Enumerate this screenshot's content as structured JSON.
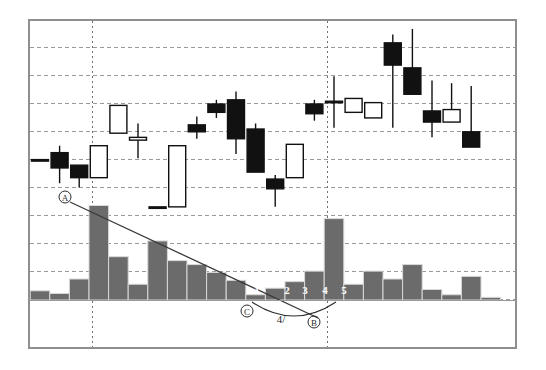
{
  "figure": {
    "background_color": "#ffffff",
    "frame_color": "#8f8f8f",
    "gridline_color": "#9a9a9a",
    "bull_body_color": "#ffffff",
    "bear_body_color": "#111111",
    "wick_color": "#111111",
    "volume_bar_color": "#6b6b6b",
    "volume_bar_edge_color": "#d9d9d9",
    "trendline_color": "#3a3a3a",
    "annotation_color": "#2b2b2b",
    "width": 546,
    "height": 370
  },
  "plot_area": {
    "left": 29,
    "top": 20,
    "right": 516,
    "bottom": 348,
    "price_panel_bottom": 300,
    "volume_baseline": 300
  },
  "annotations": {
    "point_a": {
      "label": "A",
      "x": 65,
      "y": 197
    },
    "point_b": {
      "label": "B",
      "x": 314,
      "y": 322
    },
    "point_c": {
      "label": "C",
      "x": 247,
      "y": 311
    },
    "wave_four": {
      "label": "4/",
      "x": 281,
      "y": 323
    },
    "wave_counts": [
      {
        "label": "1",
        "x": 257,
        "y": 294
      },
      {
        "label": "2",
        "x": 287,
        "y": 294
      },
      {
        "label": "3",
        "x": 305,
        "y": 294
      },
      {
        "label": "4",
        "x": 325,
        "y": 294
      },
      {
        "label": "5",
        "x": 344,
        "y": 294
      }
    ],
    "trendline": {
      "x1": 70,
      "y1": 202,
      "x2": 318,
      "y2": 318
    },
    "arc": {
      "from_x": 252,
      "from_y": 302,
      "to_x": 336,
      "to_y": 302,
      "sag": 14
    }
  },
  "gridlines": {
    "horizontal_y": [
      47,
      75,
      103,
      131,
      159,
      187,
      215,
      243,
      271,
      299
    ],
    "vertical_x": [
      92,
      327
    ]
  },
  "chart_data": {
    "type": "candlestick",
    "title": "",
    "xlabel": "",
    "ylabel": "",
    "legend": "none",
    "grid": true,
    "price_ylim": [
      0,
      100
    ],
    "volume_ylim": [
      0,
      100
    ],
    "candle_width": 17,
    "x_start": 40,
    "x_step": 19.6,
    "candles": [
      {
        "i": 0,
        "open": 50.5,
        "close": 50.5,
        "high": 50.5,
        "low": 50.5,
        "dir": "doji"
      },
      {
        "i": 1,
        "open": 53.0,
        "close": 47.5,
        "high": 55.5,
        "low": 42.0,
        "dir": "down"
      },
      {
        "i": 2,
        "open": 48.5,
        "close": 44.0,
        "high": 48.5,
        "low": 40.5,
        "dir": "down"
      },
      {
        "i": 3,
        "open": 44.0,
        "close": 55.5,
        "high": 55.5,
        "low": 44.0,
        "dir": "up"
      },
      {
        "i": 4,
        "open": 60.0,
        "close": 70.0,
        "high": 70.0,
        "low": 60.0,
        "dir": "up"
      },
      {
        "i": 5,
        "open": 57.5,
        "close": 58.5,
        "high": 63.5,
        "low": 51.0,
        "dir": "up"
      },
      {
        "i": 6,
        "open": 33.5,
        "close": 33.5,
        "high": 33.5,
        "low": 33.5,
        "dir": "doji"
      },
      {
        "i": 7,
        "open": 55.5,
        "close": 33.5,
        "high": 55.5,
        "low": 33.5,
        "dir": "up"
      },
      {
        "i": 8,
        "open": 63.0,
        "close": 60.5,
        "high": 66.0,
        "low": 58.0,
        "dir": "down"
      },
      {
        "i": 9,
        "open": 70.5,
        "close": 67.5,
        "high": 72.0,
        "low": 65.5,
        "dir": "down"
      },
      {
        "i": 10,
        "open": 72.0,
        "close": 58.0,
        "high": 75.0,
        "low": 52.5,
        "dir": "down"
      },
      {
        "i": 11,
        "open": 61.5,
        "close": 46.0,
        "high": 63.5,
        "low": 46.0,
        "dir": "down"
      },
      {
        "i": 12,
        "open": 43.5,
        "close": 40.0,
        "high": 45.0,
        "low": 33.5,
        "dir": "down"
      },
      {
        "i": 13,
        "open": 44.0,
        "close": 56.0,
        "high": 56.0,
        "low": 44.0,
        "dir": "up"
      },
      {
        "i": 14,
        "open": 70.5,
        "close": 67.0,
        "high": 72.0,
        "low": 64.5,
        "dir": "down"
      },
      {
        "i": 15,
        "open": 71.5,
        "close": 71.5,
        "high": 80.5,
        "low": 62.0,
        "dir": "doji"
      },
      {
        "i": 16,
        "open": 72.5,
        "close": 67.5,
        "high": 72.5,
        "low": 67.5,
        "dir": "up"
      },
      {
        "i": 17,
        "open": 65.5,
        "close": 71.0,
        "high": 71.0,
        "low": 65.5,
        "dir": "up"
      },
      {
        "i": 18,
        "open": 92.5,
        "close": 84.5,
        "high": 95.5,
        "low": 62.0,
        "dir": "down"
      },
      {
        "i": 19,
        "open": 83.5,
        "close": 74.0,
        "high": 97.5,
        "low": 74.0,
        "dir": "down"
      },
      {
        "i": 20,
        "open": 68.0,
        "close": 64.0,
        "high": 79.0,
        "low": 58.5,
        "dir": "down"
      },
      {
        "i": 21,
        "open": 68.5,
        "close": 64.0,
        "high": 78.0,
        "low": 64.0,
        "dir": "up"
      },
      {
        "i": 22,
        "open": 60.5,
        "close": 55.0,
        "high": 77.0,
        "low": 55.0,
        "dir": "down"
      }
    ],
    "volume": {
      "values": [
        7,
        5,
        16,
        72,
        33,
        12,
        45,
        30,
        27,
        21,
        15,
        4,
        9,
        14,
        22,
        62,
        12,
        22,
        16,
        27,
        8,
        4,
        18,
        2
      ],
      "max": 80
    }
  }
}
